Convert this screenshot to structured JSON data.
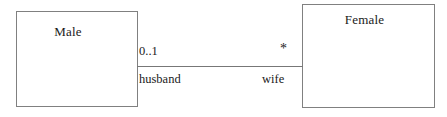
{
  "diagram": {
    "type": "uml-class-diagram",
    "background_color": "#ffffff",
    "line_color": "#777777",
    "border_color": "#808080",
    "text_color": "#1a1a1a",
    "classes": [
      {
        "id": "male",
        "name": "Male"
      },
      {
        "id": "female",
        "name": "Female"
      }
    ],
    "association": {
      "source_multiplicity": "0..1",
      "target_multiplicity": "*",
      "source_role": "husband",
      "target_role": "wife"
    }
  }
}
